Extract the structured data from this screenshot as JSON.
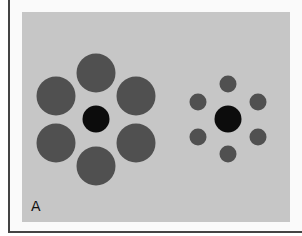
{
  "figure": {
    "panel_label": "A",
    "colors": {
      "background": "#c6c6c6",
      "surround": "#505050",
      "center": "#0c0c0c",
      "frame": "#444444"
    },
    "left_cluster": {
      "center": {
        "cx": 96,
        "cy": 119,
        "r": 13.5
      },
      "surround": [
        {
          "cx": 96,
          "cy": 73,
          "r": 19.5
        },
        {
          "cx": 56,
          "cy": 96,
          "r": 19.5
        },
        {
          "cx": 136,
          "cy": 96,
          "r": 19.5
        },
        {
          "cx": 56,
          "cy": 143,
          "r": 19.5
        },
        {
          "cx": 136,
          "cy": 143,
          "r": 19.5
        },
        {
          "cx": 96,
          "cy": 166,
          "r": 19.5
        }
      ]
    },
    "right_cluster": {
      "center": {
        "cx": 228,
        "cy": 119,
        "r": 13.5
      },
      "surround": [
        {
          "cx": 228,
          "cy": 84,
          "r": 8.5
        },
        {
          "cx": 198,
          "cy": 102,
          "r": 8.5
        },
        {
          "cx": 258,
          "cy": 102,
          "r": 8.5
        },
        {
          "cx": 198,
          "cy": 137,
          "r": 8.5
        },
        {
          "cx": 258,
          "cy": 137,
          "r": 8.5
        },
        {
          "cx": 228,
          "cy": 154,
          "r": 8.5
        }
      ]
    }
  }
}
